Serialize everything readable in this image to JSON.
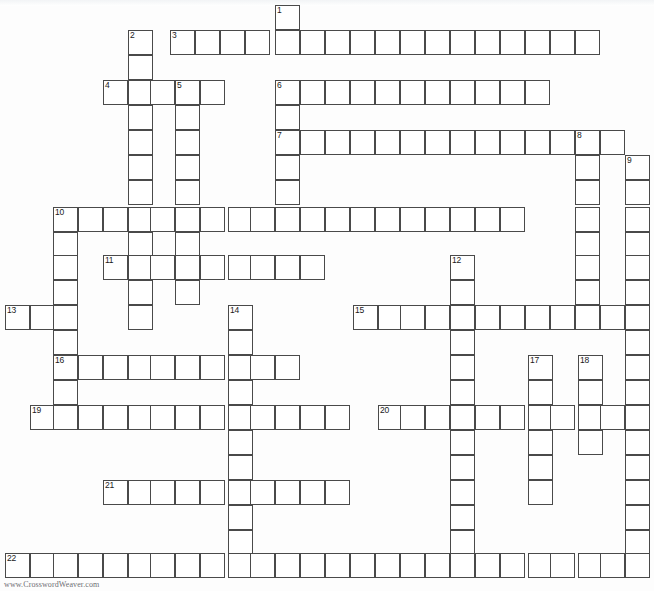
{
  "page": {
    "background_color": "#ffffff",
    "cell_border_color": "#4a4a4a",
    "cell_fill_color": "#ffffff",
    "number_color": "#1a1a1a",
    "width": 654,
    "height": 591
  },
  "footer": {
    "credit": "www.CrosswordWeaver.com"
  },
  "grid": {
    "cell_size": 25,
    "origin_x": 5,
    "origin_y": 5,
    "numbered_clues": [
      1,
      2,
      3,
      4,
      5,
      6,
      7,
      8,
      9,
      10,
      11,
      12,
      13,
      14,
      15,
      16,
      17,
      18,
      19,
      20,
      21,
      22
    ],
    "entries": [
      {
        "number": 1,
        "direction": "down",
        "x": 275,
        "y": 5,
        "length": 6
      },
      {
        "number": 2,
        "direction": "down",
        "x": 128,
        "y": 30,
        "length": 11
      },
      {
        "number": 3,
        "direction": "across",
        "x": 170,
        "y": 30,
        "length": 17
      },
      {
        "number": 4,
        "direction": "across",
        "x": 103,
        "y": 80,
        "length": 5
      },
      {
        "number": 5,
        "direction": "down",
        "x": 175,
        "y": 80,
        "length": 9
      },
      {
        "number": 6,
        "direction": "across",
        "x": 275,
        "y": 80,
        "length": 11
      },
      {
        "number": 7,
        "direction": "across",
        "x": 275,
        "y": 130,
        "length": 13
      },
      {
        "number": 8,
        "direction": "down",
        "x": 575,
        "y": 130,
        "length": 7
      },
      {
        "number": 9,
        "direction": "down",
        "x": 625,
        "y": 155,
        "length": 15
      },
      {
        "number": 10,
        "direction": "across",
        "x": 53,
        "y": 207,
        "length": 19
      },
      {
        "number": 10,
        "direction": "down",
        "x": 53,
        "y": 207,
        "length": 9
      },
      {
        "number": 11,
        "direction": "across",
        "x": 103,
        "y": 255,
        "length": 9
      },
      {
        "number": 12,
        "direction": "down",
        "x": 450,
        "y": 255,
        "length": 12
      },
      {
        "number": 13,
        "direction": "across",
        "x": 5,
        "y": 305,
        "length": 3
      },
      {
        "number": 14,
        "direction": "down",
        "x": 228,
        "y": 305,
        "length": 9
      },
      {
        "number": 15,
        "direction": "across",
        "x": 353,
        "y": 305,
        "length": 12
      },
      {
        "number": 16,
        "direction": "across",
        "x": 53,
        "y": 355,
        "length": 10
      },
      {
        "number": 17,
        "direction": "down",
        "x": 528,
        "y": 355,
        "length": 7
      },
      {
        "number": 18,
        "direction": "down",
        "x": 578,
        "y": 355,
        "length": 5
      },
      {
        "number": 19,
        "direction": "across",
        "x": 30,
        "y": 405,
        "length": 13
      },
      {
        "number": 20,
        "direction": "across",
        "x": 378,
        "y": 405,
        "length": 10
      },
      {
        "number": 21,
        "direction": "across",
        "x": 103,
        "y": 480,
        "length": 13
      },
      {
        "number": 22,
        "direction": "across",
        "x": 5,
        "y": 553,
        "length": 25
      }
    ],
    "cells": [
      {
        "x": 275,
        "y": 5,
        "n": "1"
      },
      {
        "x": 275,
        "y": 30
      },
      {
        "x": 128,
        "y": 30,
        "n": "2"
      },
      {
        "x": 128,
        "y": 55
      },
      {
        "x": 170,
        "y": 30,
        "n": "3"
      },
      {
        "x": 195,
        "y": 30
      },
      {
        "x": 220,
        "y": 30
      },
      {
        "x": 245,
        "y": 30
      },
      {
        "x": 300,
        "y": 30
      },
      {
        "x": 325,
        "y": 30
      },
      {
        "x": 350,
        "y": 30
      },
      {
        "x": 375,
        "y": 30
      },
      {
        "x": 400,
        "y": 30
      },
      {
        "x": 425,
        "y": 30
      },
      {
        "x": 450,
        "y": 30
      },
      {
        "x": 475,
        "y": 30
      },
      {
        "x": 500,
        "y": 30
      },
      {
        "x": 525,
        "y": 30
      },
      {
        "x": 550,
        "y": 30
      },
      {
        "x": 575,
        "y": 30
      },
      {
        "x": 103,
        "y": 80,
        "n": "4"
      },
      {
        "x": 128,
        "y": 80
      },
      {
        "x": 150,
        "y": 80
      },
      {
        "x": 175,
        "y": 80,
        "n": "5"
      },
      {
        "x": 200,
        "y": 80
      },
      {
        "x": 275,
        "y": 80,
        "n": "6"
      },
      {
        "x": 300,
        "y": 80
      },
      {
        "x": 325,
        "y": 80
      },
      {
        "x": 350,
        "y": 80
      },
      {
        "x": 375,
        "y": 80
      },
      {
        "x": 400,
        "y": 80
      },
      {
        "x": 425,
        "y": 80
      },
      {
        "x": 450,
        "y": 80
      },
      {
        "x": 475,
        "y": 80
      },
      {
        "x": 500,
        "y": 80
      },
      {
        "x": 525,
        "y": 80
      },
      {
        "x": 128,
        "y": 105
      },
      {
        "x": 175,
        "y": 105
      },
      {
        "x": 275,
        "y": 105
      },
      {
        "x": 275,
        "y": 130,
        "n": "7"
      },
      {
        "x": 300,
        "y": 130
      },
      {
        "x": 325,
        "y": 130
      },
      {
        "x": 350,
        "y": 130
      },
      {
        "x": 375,
        "y": 130
      },
      {
        "x": 400,
        "y": 130
      },
      {
        "x": 425,
        "y": 130
      },
      {
        "x": 450,
        "y": 130
      },
      {
        "x": 475,
        "y": 130
      },
      {
        "x": 500,
        "y": 130
      },
      {
        "x": 525,
        "y": 130
      },
      {
        "x": 550,
        "y": 130
      },
      {
        "x": 575,
        "y": 130,
        "n": "8"
      },
      {
        "x": 600,
        "y": 130
      },
      {
        "x": 128,
        "y": 130
      },
      {
        "x": 175,
        "y": 130
      },
      {
        "x": 625,
        "y": 155,
        "n": "9"
      },
      {
        "x": 575,
        "y": 155
      },
      {
        "x": 275,
        "y": 155
      },
      {
        "x": 128,
        "y": 155
      },
      {
        "x": 175,
        "y": 155
      },
      {
        "x": 625,
        "y": 180
      },
      {
        "x": 575,
        "y": 180
      },
      {
        "x": 275,
        "y": 180
      },
      {
        "x": 128,
        "y": 180
      },
      {
        "x": 175,
        "y": 180
      },
      {
        "x": 53,
        "y": 207,
        "n": "10"
      },
      {
        "x": 78,
        "y": 207
      },
      {
        "x": 103,
        "y": 207
      },
      {
        "x": 128,
        "y": 207
      },
      {
        "x": 150,
        "y": 207
      },
      {
        "x": 175,
        "y": 207
      },
      {
        "x": 200,
        "y": 207
      },
      {
        "x": 228,
        "y": 207
      },
      {
        "x": 250,
        "y": 207
      },
      {
        "x": 275,
        "y": 207
      },
      {
        "x": 300,
        "y": 207
      },
      {
        "x": 325,
        "y": 207
      },
      {
        "x": 350,
        "y": 207
      },
      {
        "x": 375,
        "y": 207
      },
      {
        "x": 400,
        "y": 207
      },
      {
        "x": 425,
        "y": 207
      },
      {
        "x": 450,
        "y": 207
      },
      {
        "x": 475,
        "y": 207
      },
      {
        "x": 500,
        "y": 207
      },
      {
        "x": 575,
        "y": 207
      },
      {
        "x": 625,
        "y": 207
      },
      {
        "x": 53,
        "y": 232
      },
      {
        "x": 128,
        "y": 232
      },
      {
        "x": 175,
        "y": 232
      },
      {
        "x": 575,
        "y": 232
      },
      {
        "x": 625,
        "y": 232
      },
      {
        "x": 103,
        "y": 255,
        "n": "11"
      },
      {
        "x": 128,
        "y": 255
      },
      {
        "x": 150,
        "y": 255
      },
      {
        "x": 175,
        "y": 255
      },
      {
        "x": 200,
        "y": 255
      },
      {
        "x": 228,
        "y": 255
      },
      {
        "x": 250,
        "y": 255
      },
      {
        "x": 275,
        "y": 255
      },
      {
        "x": 300,
        "y": 255
      },
      {
        "x": 53,
        "y": 255
      },
      {
        "x": 450,
        "y": 255,
        "n": "12"
      },
      {
        "x": 575,
        "y": 255
      },
      {
        "x": 625,
        "y": 255
      },
      {
        "x": 53,
        "y": 280
      },
      {
        "x": 128,
        "y": 280
      },
      {
        "x": 175,
        "y": 280
      },
      {
        "x": 450,
        "y": 280
      },
      {
        "x": 575,
        "y": 280
      },
      {
        "x": 625,
        "y": 280
      },
      {
        "x": 5,
        "y": 305,
        "n": "13"
      },
      {
        "x": 30,
        "y": 305
      },
      {
        "x": 53,
        "y": 305
      },
      {
        "x": 128,
        "y": 305
      },
      {
        "x": 228,
        "y": 305,
        "n": "14"
      },
      {
        "x": 353,
        "y": 305,
        "n": "15"
      },
      {
        "x": 378,
        "y": 305
      },
      {
        "x": 400,
        "y": 305
      },
      {
        "x": 425,
        "y": 305
      },
      {
        "x": 450,
        "y": 305
      },
      {
        "x": 475,
        "y": 305
      },
      {
        "x": 500,
        "y": 305
      },
      {
        "x": 525,
        "y": 305
      },
      {
        "x": 550,
        "y": 305
      },
      {
        "x": 575,
        "y": 305
      },
      {
        "x": 600,
        "y": 305
      },
      {
        "x": 625,
        "y": 305
      },
      {
        "x": 53,
        "y": 330
      },
      {
        "x": 228,
        "y": 330
      },
      {
        "x": 450,
        "y": 330
      },
      {
        "x": 625,
        "y": 330
      },
      {
        "x": 53,
        "y": 355,
        "n": "16"
      },
      {
        "x": 78,
        "y": 355
      },
      {
        "x": 103,
        "y": 355
      },
      {
        "x": 128,
        "y": 355
      },
      {
        "x": 150,
        "y": 355
      },
      {
        "x": 175,
        "y": 355
      },
      {
        "x": 200,
        "y": 355
      },
      {
        "x": 228,
        "y": 355
      },
      {
        "x": 250,
        "y": 355
      },
      {
        "x": 275,
        "y": 355
      },
      {
        "x": 450,
        "y": 355
      },
      {
        "x": 528,
        "y": 355,
        "n": "17"
      },
      {
        "x": 578,
        "y": 355,
        "n": "18"
      },
      {
        "x": 625,
        "y": 355
      },
      {
        "x": 53,
        "y": 380
      },
      {
        "x": 228,
        "y": 380
      },
      {
        "x": 450,
        "y": 380
      },
      {
        "x": 528,
        "y": 380
      },
      {
        "x": 578,
        "y": 380
      },
      {
        "x": 625,
        "y": 380
      },
      {
        "x": 30,
        "y": 405,
        "n": "19"
      },
      {
        "x": 53,
        "y": 405
      },
      {
        "x": 78,
        "y": 405
      },
      {
        "x": 103,
        "y": 405
      },
      {
        "x": 128,
        "y": 405
      },
      {
        "x": 150,
        "y": 405
      },
      {
        "x": 175,
        "y": 405
      },
      {
        "x": 200,
        "y": 405
      },
      {
        "x": 228,
        "y": 405
      },
      {
        "x": 250,
        "y": 405
      },
      {
        "x": 275,
        "y": 405
      },
      {
        "x": 300,
        "y": 405
      },
      {
        "x": 325,
        "y": 405
      },
      {
        "x": 378,
        "y": 405,
        "n": "20"
      },
      {
        "x": 400,
        "y": 405
      },
      {
        "x": 425,
        "y": 405
      },
      {
        "x": 450,
        "y": 405
      },
      {
        "x": 475,
        "y": 405
      },
      {
        "x": 500,
        "y": 405
      },
      {
        "x": 528,
        "y": 405
      },
      {
        "x": 550,
        "y": 405
      },
      {
        "x": 578,
        "y": 405
      },
      {
        "x": 600,
        "y": 405
      },
      {
        "x": 625,
        "y": 405
      },
      {
        "x": 228,
        "y": 430
      },
      {
        "x": 450,
        "y": 430
      },
      {
        "x": 528,
        "y": 430
      },
      {
        "x": 578,
        "y": 430
      },
      {
        "x": 625,
        "y": 430
      },
      {
        "x": 228,
        "y": 455
      },
      {
        "x": 450,
        "y": 455
      },
      {
        "x": 528,
        "y": 455
      },
      {
        "x": 625,
        "y": 455
      },
      {
        "x": 103,
        "y": 480,
        "n": "21"
      },
      {
        "x": 128,
        "y": 480
      },
      {
        "x": 150,
        "y": 480
      },
      {
        "x": 175,
        "y": 480
      },
      {
        "x": 200,
        "y": 480
      },
      {
        "x": 228,
        "y": 480
      },
      {
        "x": 250,
        "y": 480
      },
      {
        "x": 275,
        "y": 480
      },
      {
        "x": 300,
        "y": 480
      },
      {
        "x": 325,
        "y": 480
      },
      {
        "x": 450,
        "y": 480
      },
      {
        "x": 528,
        "y": 480
      },
      {
        "x": 625,
        "y": 480
      },
      {
        "x": 228,
        "y": 505
      },
      {
        "x": 450,
        "y": 505
      },
      {
        "x": 625,
        "y": 505
      },
      {
        "x": 228,
        "y": 530
      },
      {
        "x": 450,
        "y": 530
      },
      {
        "x": 625,
        "y": 530
      },
      {
        "x": 5,
        "y": 553,
        "n": "22"
      },
      {
        "x": 30,
        "y": 553
      },
      {
        "x": 53,
        "y": 553
      },
      {
        "x": 78,
        "y": 553
      },
      {
        "x": 103,
        "y": 553
      },
      {
        "x": 128,
        "y": 553
      },
      {
        "x": 150,
        "y": 553
      },
      {
        "x": 175,
        "y": 553
      },
      {
        "x": 200,
        "y": 553
      },
      {
        "x": 228,
        "y": 553
      },
      {
        "x": 250,
        "y": 553
      },
      {
        "x": 275,
        "y": 553
      },
      {
        "x": 300,
        "y": 553
      },
      {
        "x": 325,
        "y": 553
      },
      {
        "x": 350,
        "y": 553
      },
      {
        "x": 375,
        "y": 553
      },
      {
        "x": 400,
        "y": 553
      },
      {
        "x": 425,
        "y": 553
      },
      {
        "x": 450,
        "y": 553
      },
      {
        "x": 475,
        "y": 553
      },
      {
        "x": 500,
        "y": 553
      },
      {
        "x": 528,
        "y": 553
      },
      {
        "x": 550,
        "y": 553
      },
      {
        "x": 578,
        "y": 553
      },
      {
        "x": 600,
        "y": 553
      },
      {
        "x": 625,
        "y": 553
      }
    ]
  }
}
